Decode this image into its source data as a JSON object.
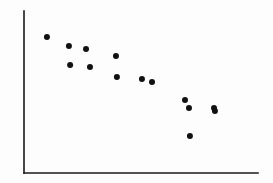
{
  "figure": {
    "background_color": "#fdfdfd",
    "width": 273,
    "height": 183
  },
  "chart_data": {
    "type": "scatter",
    "title": "",
    "subtitle": "",
    "xlabel": "",
    "ylabel": "",
    "xlim": [
      0,
      100
    ],
    "ylim": [
      0,
      100
    ],
    "grid": false,
    "legend": null,
    "legend_position": "none",
    "xticks": [],
    "yticks": [],
    "xticklabels": [],
    "yticklabels": [],
    "annotations": [],
    "marker": {
      "shape": "circle",
      "color": "#111111",
      "size_px": 6
    },
    "axis": {
      "color": "#1a1a1a",
      "width_px": 1.6,
      "spines": [
        "left",
        "bottom"
      ],
      "origin_px": [
        24,
        173
      ],
      "x_end_px": 258,
      "y_top_px": 11
    },
    "n_points": 14,
    "relationship": "negative",
    "series": [
      {
        "name": "observations",
        "color": "#111111",
        "x": [
          9.8,
          19.2,
          26.5,
          19.7,
          28.2,
          39.3,
          39.7,
          50.4,
          54.7,
          68.8,
          70.5,
          81.2,
          70.9,
          81.6
        ],
        "y": [
          84.0,
          78.4,
          76.5,
          66.7,
          65.4,
          72.2,
          59.3,
          58.0,
          56.2,
          45.1,
          40.1,
          40.1,
          22.8,
          38.3
        ]
      }
    ],
    "points_px": [
      [
        47,
        37
      ],
      [
        69,
        46
      ],
      [
        86,
        49
      ],
      [
        70,
        65
      ],
      [
        90,
        67
      ],
      [
        116,
        56
      ],
      [
        117,
        77
      ],
      [
        142,
        79
      ],
      [
        152,
        82
      ],
      [
        185,
        100
      ],
      [
        189,
        108
      ],
      [
        214,
        111
      ],
      [
        189,
        136
      ],
      [
        215,
        112
      ]
    ]
  }
}
